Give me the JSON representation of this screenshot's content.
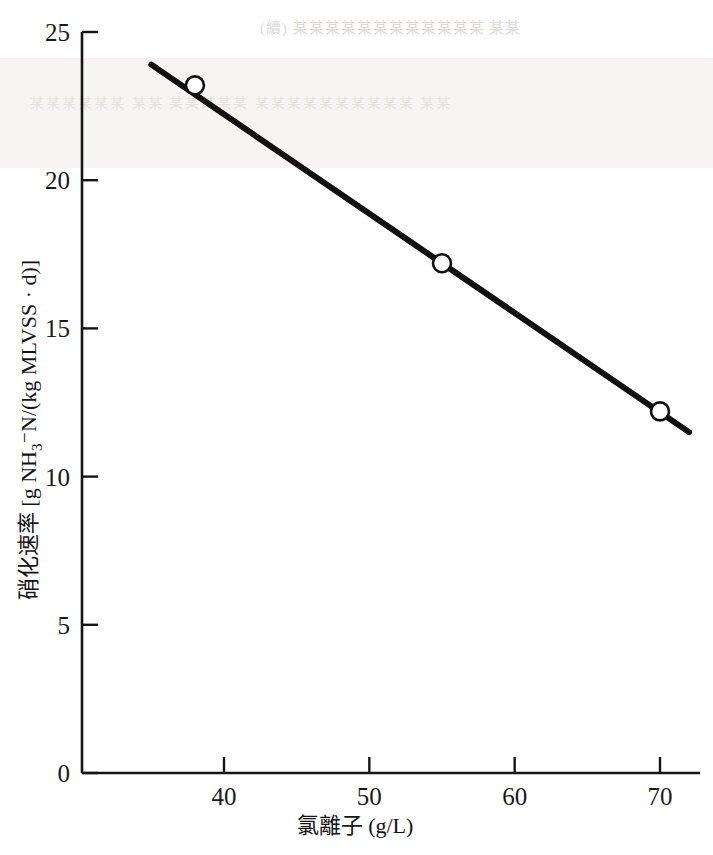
{
  "figure": {
    "background_color": "#ffffff",
    "ink_color": "#111111",
    "bleed_through_1": "(續) 某某某某某某某某某某某某 某某",
    "bleed_through_2": "某某某某某某 某某 某某某某某 某某某某某某某某某某 某某"
  },
  "chart_data": {
    "type": "line",
    "title": "",
    "xlabel": "氯離子 (g/L)",
    "ylabel_parts": {
      "prefix": "硝化速率 [g NH",
      "sub": "3",
      "mid": "⁻N/(kg MLVSS · d)]"
    },
    "ylabel": "硝化速率 [g NH3⁻N/(kg MLVSS · d)]",
    "xlim": [
      35,
      72.5
    ],
    "ylim": [
      0,
      25
    ],
    "xticks": [
      40,
      50,
      60,
      70
    ],
    "xtick_labels": [
      "40",
      "50",
      "60",
      "70"
    ],
    "yticks": [
      0,
      5,
      10,
      15,
      20,
      25
    ],
    "ytick_labels": [
      "0",
      "5",
      "10",
      "15",
      "20",
      "25"
    ],
    "grid": false,
    "legend": "none",
    "tick_direction": "in",
    "axis_style": "left-and-bottom-spines",
    "series": [
      {
        "name": "nitrification rate vs chloride",
        "marker": "open-circle",
        "line_style": "solid",
        "line_color": "#111111",
        "line_width_px": 6,
        "fit_line_endpoints": [
          {
            "x": 35.0,
            "y": 23.9
          },
          {
            "x": 72.0,
            "y": 11.5
          }
        ],
        "points": [
          {
            "x": 38.0,
            "y": 23.2
          },
          {
            "x": 55.0,
            "y": 17.2
          },
          {
            "x": 70.0,
            "y": 12.2
          }
        ]
      }
    ]
  }
}
